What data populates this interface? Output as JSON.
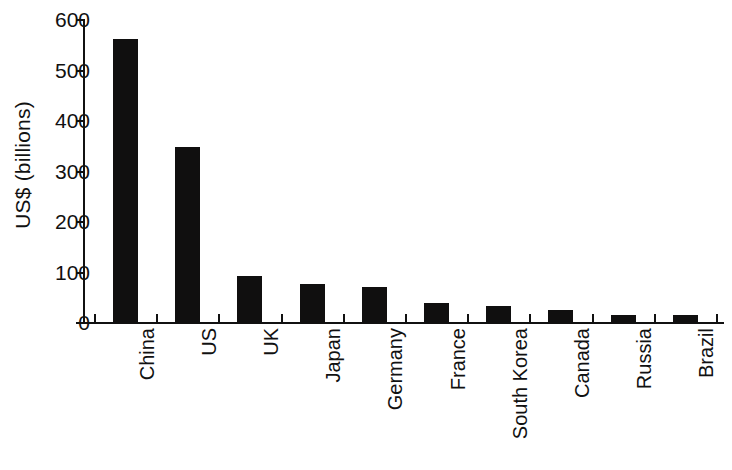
{
  "chart_data": {
    "type": "bar",
    "title": "",
    "xlabel": "",
    "ylabel": "US$ (billions)",
    "categories": [
      "China",
      "US",
      "UK",
      "Japan",
      "Germany",
      "France",
      "South Korea",
      "Canada",
      "Russia",
      "Brazil"
    ],
    "values": [
      563,
      348,
      93,
      77,
      71,
      40,
      33,
      25,
      16,
      15
    ],
    "ylim": [
      0,
      600
    ],
    "yticks": [
      0,
      100,
      200,
      300,
      400,
      500,
      600
    ],
    "ytick_labels": [
      "0",
      "100",
      "200",
      "300",
      "400",
      "500",
      "600"
    ],
    "grid": false,
    "legend": null,
    "bar_color": "#100f0f",
    "axis_color": "#111111",
    "background": "#ffffff"
  }
}
